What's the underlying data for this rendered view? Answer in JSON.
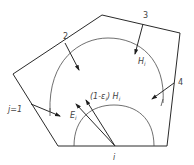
{
  "diagram": {
    "type": "radiation-enclosure",
    "colors": {
      "stroke": "#2a2a2a",
      "arc": "#4a4a4a",
      "text": "#444444",
      "background": "#ffffff"
    },
    "labels": {
      "surface_i": "i",
      "surface_j1": "j=1",
      "surface_2": "2",
      "surface_3": "3",
      "surface_4": "4",
      "emission": "E",
      "emission_sub": "i",
      "irradiation": "H",
      "irradiation_sub": "i",
      "reflected_prefix": "(1-ε",
      "reflected_prefix_sub": "i",
      "reflected_mid": ") H",
      "reflected_sub": "i"
    }
  }
}
